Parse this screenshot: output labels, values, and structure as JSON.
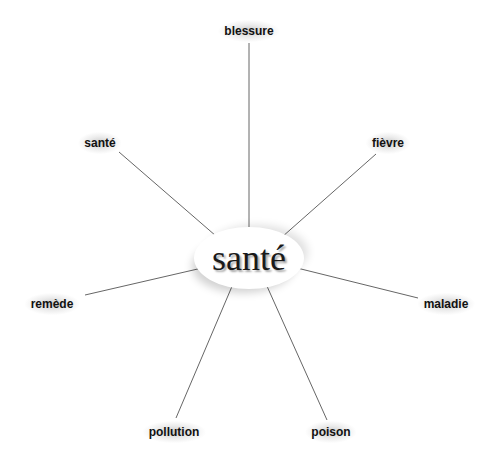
{
  "center": {
    "word": "santé"
  },
  "branches": [
    {
      "id": "blessure",
      "label": "blessure"
    },
    {
      "id": "sante",
      "label": "santé"
    },
    {
      "id": "fievre",
      "label": "fièvre"
    },
    {
      "id": "remede",
      "label": "remède"
    },
    {
      "id": "maladie",
      "label": "maladie"
    },
    {
      "id": "pollution",
      "label": "pollution"
    },
    {
      "id": "poison",
      "label": "poison"
    }
  ],
  "colors": {
    "line": "#555555",
    "text": "#111111"
  }
}
